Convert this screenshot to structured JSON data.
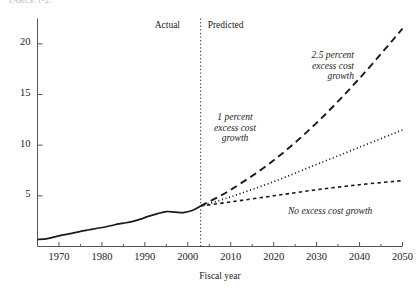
{
  "page": {
    "clipped_header_text": "TABLE 1-2.",
    "background": "#ffffff",
    "ink": "#1a1a1a"
  },
  "chart_data": {
    "type": "line",
    "title": "",
    "xlabel": "Fiscal year",
    "ylabel": "",
    "xlim": [
      1965,
      2050
    ],
    "ylim": [
      0,
      22.5
    ],
    "grid": false,
    "legend": "inline-annotations",
    "xticks": [
      1970,
      1980,
      1990,
      2000,
      2010,
      2020,
      2030,
      2040,
      2050
    ],
    "xtick_labels": [
      "1970",
      "1980",
      "1990",
      "2000",
      "2010",
      "2020",
      "2030",
      "2040",
      "2050"
    ],
    "yticks": [
      5,
      10,
      15,
      20
    ],
    "ytick_labels": [
      "5",
      "10",
      "15",
      "20"
    ],
    "divider_x": 2003,
    "phase_labels": [
      {
        "text": "Actual",
        "x": 1993,
        "align": "right"
      },
      {
        "text": "Predicted",
        "x": 2013,
        "align": "left"
      }
    ],
    "series": [
      {
        "name": "Actual",
        "style": "solid",
        "x": [
          1965,
          1967,
          1969,
          1971,
          1973,
          1975,
          1977,
          1979,
          1981,
          1983,
          1985,
          1987,
          1989,
          1991,
          1993,
          1995,
          1997,
          1999,
          2001,
          2003
        ],
        "values": [
          0.7,
          0.75,
          0.95,
          1.15,
          1.3,
          1.5,
          1.65,
          1.8,
          1.95,
          2.15,
          2.3,
          2.45,
          2.7,
          3.0,
          3.25,
          3.45,
          3.4,
          3.35,
          3.55,
          4.0
        ]
      },
      {
        "name": "2.5 percent excess cost growth",
        "style": "long-dash",
        "x": [
          2003,
          2010,
          2020,
          2030,
          2040,
          2050
        ],
        "values": [
          4.0,
          5.6,
          8.5,
          12.2,
          16.6,
          21.5
        ]
      },
      {
        "name": "1 percent excess cost growth",
        "style": "dotted",
        "x": [
          2003,
          2010,
          2020,
          2030,
          2040,
          2050
        ],
        "values": [
          4.0,
          4.9,
          6.4,
          8.1,
          9.8,
          11.5
        ]
      },
      {
        "name": "No excess cost growth",
        "style": "short-dash",
        "x": [
          2003,
          2010,
          2020,
          2030,
          2040,
          2050
        ],
        "values": [
          4.0,
          4.4,
          5.0,
          5.6,
          6.1,
          6.5
        ]
      }
    ],
    "annotations": [
      {
        "id": "annot-high-growth",
        "lines": [
          "2.5 percent",
          "excess cost",
          "growth"
        ],
        "align": "right",
        "style": "italic"
      },
      {
        "id": "annot-mid-growth",
        "lines": [
          "1 percent",
          "excess cost",
          "growth"
        ],
        "align": "center",
        "style": "italic"
      },
      {
        "id": "annot-no-growth",
        "lines": [
          "No excess cost growth"
        ],
        "align": "left",
        "style": "italic"
      }
    ]
  }
}
